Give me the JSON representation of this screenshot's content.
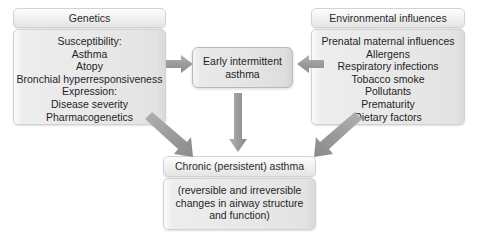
{
  "diagram": {
    "arrow_color": "#9a9a9a",
    "panel_fill": "#e8e8e8"
  },
  "genetics": {
    "header": "Genetics",
    "lines": [
      "Susceptibility:",
      "Asthma",
      "Atopy",
      "Bronchial hyperresponsiveness",
      "Expression:",
      "Disease severity",
      "Pharmacogenetics"
    ]
  },
  "environment": {
    "header": "Environmental influences",
    "lines": [
      "Prenatal maternal influences",
      "Allergens",
      "Respiratory infections",
      "Tobacco smoke",
      "Pollutants",
      "Prematurity",
      "Dietary factors"
    ]
  },
  "early": {
    "label": "Early intermittent asthma"
  },
  "chronic": {
    "header": "Chronic (persistent) asthma",
    "lines": [
      "(reversible and irreversible",
      "changes in airway structure",
      "and function)"
    ]
  },
  "arrows": {
    "genetics_to_early": "arrow-right",
    "environment_to_early": "arrow-left",
    "early_to_chronic": "arrow-down",
    "genetics_to_chronic": "arrow-diagonal-down-right",
    "environment_to_chronic": "arrow-diagonal-down-left"
  }
}
